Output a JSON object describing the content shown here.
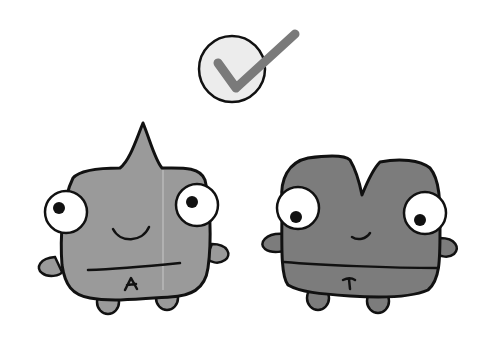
{
  "scene": {
    "description": "Two cartoon letter monsters with a check mark above",
    "check_mark": {
      "icon": "check-circle-icon",
      "circle_fill": "#ececec",
      "check_color": "#7a7a7a"
    },
    "monsters": [
      {
        "letter": "A",
        "body_color": "#9a9a9a"
      },
      {
        "letter": "T",
        "body_color": "#7c7c7c"
      }
    ],
    "outline_color": "#111111"
  }
}
